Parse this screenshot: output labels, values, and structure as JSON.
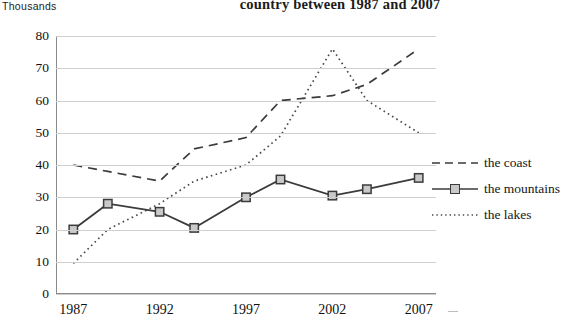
{
  "chart_data": {
    "type": "line",
    "title": "country between 1987 and 2007",
    "ylabel": "Thousands",
    "xlabel": "",
    "x": [
      1987,
      1989,
      1992,
      1994,
      1997,
      1999,
      2002,
      2004,
      2007
    ],
    "xticks": [
      "1987",
      "1992",
      "1997",
      "2002",
      "2007"
    ],
    "xtick_values": [
      1987,
      1992,
      1997,
      2002,
      2007
    ],
    "yticks": [
      "0",
      "10",
      "20",
      "30",
      "40",
      "50",
      "60",
      "70",
      "80"
    ],
    "ytick_values": [
      0,
      10,
      20,
      30,
      40,
      50,
      60,
      70,
      80
    ],
    "ylim": [
      0,
      80
    ],
    "xlim": [
      1986,
      2008
    ],
    "grid": true,
    "legend_position": "right",
    "series": [
      {
        "name": "the coast",
        "style": "dashed",
        "color": "#3b3b3b",
        "marker": "none",
        "values": [
          40,
          38,
          35,
          45,
          48.5,
          60,
          61.5,
          65,
          76
        ]
      },
      {
        "name": "the mountains",
        "style": "solid",
        "color": "#3b3b3b",
        "marker": "square",
        "values": [
          20,
          28,
          25.5,
          20.5,
          30,
          35.5,
          30.5,
          32.5,
          36
        ]
      },
      {
        "name": "the lakes",
        "style": "dotted",
        "color": "#4a4a4a",
        "marker": "none",
        "values": [
          9.5,
          20,
          28,
          35,
          40,
          49,
          76,
          60,
          50
        ]
      }
    ]
  },
  "legend": {
    "items": [
      {
        "label": "the coast",
        "key": "dashed-line-key"
      },
      {
        "label": "the mountains",
        "key": "solid-square-line-key"
      },
      {
        "label": "the lakes",
        "key": "dotted-line-key"
      }
    ]
  }
}
